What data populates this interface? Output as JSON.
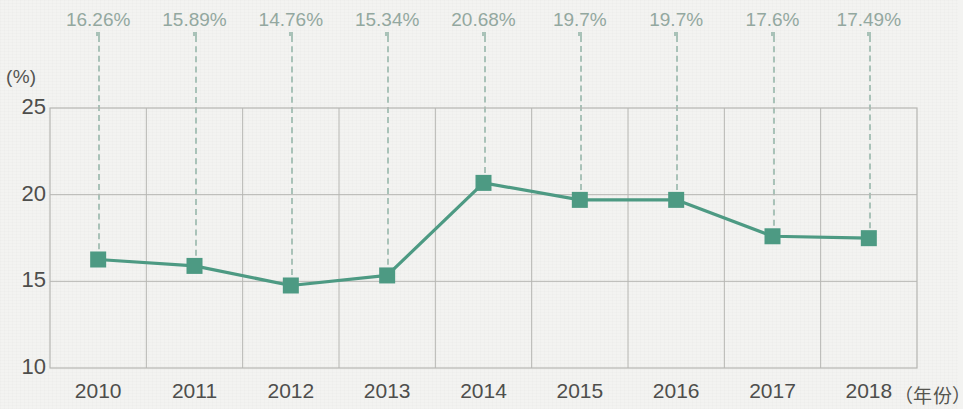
{
  "chart_data": {
    "type": "line",
    "title": "",
    "xlabel": "（年份）",
    "ylabel": "(%)",
    "categories": [
      "2010",
      "2011",
      "2012",
      "2013",
      "2014",
      "2015",
      "2016",
      "2017",
      "2018"
    ],
    "values": [
      16.26,
      15.89,
      14.76,
      15.34,
      20.68,
      19.7,
      19.7,
      17.6,
      17.49
    ],
    "data_labels": [
      "16.26%",
      "15.89%",
      "14.76%",
      "15.34%",
      "20.68%",
      "19.7%",
      "19.7%",
      "17.6%",
      "17.49%"
    ],
    "ylim": [
      10,
      25
    ],
    "y_ticks": [
      "10",
      "15",
      "20",
      "25"
    ],
    "y_tick_values": [
      10,
      15,
      20,
      25
    ],
    "grid": true,
    "legend": null,
    "series": [
      {
        "name": "",
        "values": [
          16.26,
          15.89,
          14.76,
          15.34,
          20.68,
          19.7,
          19.7,
          17.6,
          17.49
        ]
      }
    ],
    "colors": {
      "line": "#4d9a83",
      "marker": "#4d9a83",
      "label_text": "#93a8a0",
      "leader_line": "#a9c2b8",
      "axis_text": "#4e4e4c",
      "grid": "#b6b6b2",
      "background": "#f3f3f1"
    },
    "marker_shape": "square"
  }
}
